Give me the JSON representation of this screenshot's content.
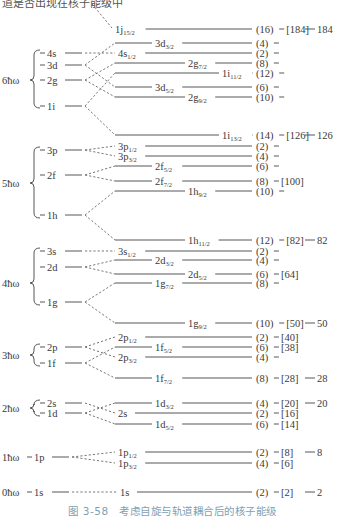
{
  "top_text": "道是否出现在核子能级中",
  "caption": "图 3-58　考虑自旋与轨道耦合后的核子能级",
  "shells": [
    {
      "label": "6ħω",
      "label_y": 80,
      "brace": [
        50,
        108
      ],
      "left_levels": [
        {
          "name": "4s",
          "y": 53
        },
        {
          "name": "3d",
          "y": 65
        },
        {
          "name": "2g",
          "y": 80
        },
        {
          "name": "1i",
          "y": 106
        }
      ]
    },
    {
      "label": "5ħω",
      "label_y": 183,
      "brace": [
        147,
        218
      ],
      "left_levels": [
        {
          "name": "3p",
          "y": 150
        },
        {
          "name": "2f",
          "y": 175
        },
        {
          "name": "1h",
          "y": 215
        }
      ]
    },
    {
      "label": "4ħω",
      "label_y": 283,
      "brace": [
        248,
        305
      ],
      "left_levels": [
        {
          "name": "3s",
          "y": 251
        },
        {
          "name": "2d",
          "y": 267
        },
        {
          "name": "1g",
          "y": 302
        }
      ]
    },
    {
      "label": "3ħω",
      "label_y": 355,
      "brace": [
        344,
        366
      ],
      "left_levels": [
        {
          "name": "2p",
          "y": 347
        },
        {
          "name": "1f",
          "y": 363
        }
      ]
    },
    {
      "label": "2ħω",
      "label_y": 408,
      "brace": [
        400,
        416
      ],
      "left_levels": [
        {
          "name": "2s",
          "y": 403
        },
        {
          "name": "1d",
          "y": 413
        }
      ]
    },
    {
      "label": "1ħω",
      "label_y": 457,
      "brace": null,
      "left_levels": [
        {
          "name": "1p",
          "y": 457
        }
      ]
    },
    {
      "label": "0ħω",
      "label_y": 492,
      "brace": null,
      "left_levels": [
        {
          "name": "1s",
          "y": 492
        }
      ]
    }
  ],
  "split_levels": [
    {
      "base": "1j",
      "sub": "15/2",
      "y": 29,
      "label_x": 115,
      "line_start": 140,
      "degeneracy": "(16)",
      "cumulative": "[184]",
      "magic": "184",
      "from": null
    },
    {
      "base": "3d",
      "sub": "3/2",
      "y": 43,
      "label_x": 155,
      "line_start": 115,
      "degeneracy": "(4)",
      "cumulative": "",
      "magic": "",
      "from": "3d"
    },
    {
      "base": "4s",
      "sub": "1/2",
      "y": 53,
      "label_x": 118,
      "line_start": 140,
      "degeneracy": "(2)",
      "cumulative": "",
      "magic": "",
      "from": "4s"
    },
    {
      "base": "2g",
      "sub": "7/2",
      "y": 63,
      "label_x": 188,
      "line_start": 115,
      "degeneracy": "(8)",
      "cumulative": "",
      "magic": "",
      "from": "2g"
    },
    {
      "base": "1i",
      "sub": "11/2",
      "y": 73,
      "label_x": 222,
      "line_start": 115,
      "degeneracy": "(12)",
      "cumulative": "",
      "magic": "",
      "from": "1i"
    },
    {
      "base": "3d",
      "sub": "5/2",
      "y": 87,
      "label_x": 155,
      "line_start": 115,
      "degeneracy": "(6)",
      "cumulative": "",
      "magic": "",
      "from": "3d"
    },
    {
      "base": "2g",
      "sub": "9/2",
      "y": 97,
      "label_x": 188,
      "line_start": 115,
      "degeneracy": "(10)",
      "cumulative": "",
      "magic": "",
      "from": "2g"
    },
    {
      "base": "1i",
      "sub": "13/2",
      "y": 135,
      "label_x": 222,
      "line_start": 115,
      "degeneracy": "(14)",
      "cumulative": "[126]",
      "magic": "126",
      "from": "1i"
    },
    {
      "base": "3p",
      "sub": "1/2",
      "y": 146,
      "label_x": 118,
      "line_start": 140,
      "degeneracy": "(2)",
      "cumulative": "",
      "magic": "",
      "from": "3p"
    },
    {
      "base": "3p",
      "sub": "3/2",
      "y": 156,
      "label_x": 118,
      "line_start": 140,
      "degeneracy": "(4)",
      "cumulative": "",
      "magic": "",
      "from": "3p"
    },
    {
      "base": "2f",
      "sub": "5/2",
      "y": 166,
      "label_x": 155,
      "line_start": 115,
      "degeneracy": "(6)",
      "cumulative": "",
      "magic": "",
      "from": "2f"
    },
    {
      "base": "2f",
      "sub": "7/2",
      "y": 181,
      "label_x": 155,
      "line_start": 115,
      "degeneracy": "(8)",
      "cumulative": "[100]",
      "magic": "",
      "from": "2f"
    },
    {
      "base": "1h",
      "sub": "9/2",
      "y": 191,
      "label_x": 188,
      "line_start": 115,
      "degeneracy": "(10)",
      "cumulative": "",
      "magic": "",
      "from": "1h"
    },
    {
      "base": "1h",
      "sub": "11/2",
      "y": 240,
      "label_x": 188,
      "line_start": 115,
      "degeneracy": "(12)",
      "cumulative": "[82]",
      "magic": "82",
      "from": "1h"
    },
    {
      "base": "3s",
      "sub": "1/2",
      "y": 251,
      "label_x": 118,
      "line_start": 140,
      "degeneracy": "(2)",
      "cumulative": "",
      "magic": "",
      "from": "3s"
    },
    {
      "base": "2d",
      "sub": "3/2",
      "y": 260,
      "label_x": 155,
      "line_start": 115,
      "degeneracy": "(4)",
      "cumulative": "",
      "magic": "",
      "from": "2d"
    },
    {
      "base": "2d",
      "sub": "5/2",
      "y": 274,
      "label_x": 188,
      "line_start": 115,
      "degeneracy": "(6)",
      "cumulative": "[64]",
      "magic": "",
      "from": "2d"
    },
    {
      "base": "1g",
      "sub": "7/2",
      "y": 283,
      "label_x": 155,
      "line_start": 115,
      "degeneracy": "(8)",
      "cumulative": "",
      "magic": "",
      "from": "1g"
    },
    {
      "base": "1g",
      "sub": "9/2",
      "y": 323,
      "label_x": 188,
      "line_start": 115,
      "degeneracy": "(10)",
      "cumulative": "[50]",
      "magic": "50",
      "from": "1g"
    },
    {
      "base": "2p",
      "sub": "1/2",
      "y": 337,
      "label_x": 118,
      "line_start": 140,
      "degeneracy": "(2)",
      "cumulative": "[40]",
      "magic": "",
      "from": "2p"
    },
    {
      "base": "1f",
      "sub": "5/2",
      "y": 347,
      "label_x": 155,
      "line_start": 115,
      "degeneracy": "(6)",
      "cumulative": "[38]",
      "magic": "",
      "from": "1f"
    },
    {
      "base": "2p",
      "sub": "3/2",
      "y": 357,
      "label_x": 118,
      "line_start": 140,
      "degeneracy": "(4)",
      "cumulative": "",
      "magic": "",
      "from": "2p"
    },
    {
      "base": "1f",
      "sub": "7/2",
      "y": 378,
      "label_x": 155,
      "line_start": 115,
      "degeneracy": "(8)",
      "cumulative": "[28]",
      "magic": "28",
      "from": "1f"
    },
    {
      "base": "1d",
      "sub": "3/2",
      "y": 403,
      "label_x": 155,
      "line_start": 115,
      "degeneracy": "(4)",
      "cumulative": "[20]",
      "magic": "20",
      "from": "1d"
    },
    {
      "base": "2s",
      "sub": "",
      "y": 413,
      "label_x": 118,
      "line_start": 140,
      "degeneracy": "(2)",
      "cumulative": "[16]",
      "magic": "",
      "from": "2s"
    },
    {
      "base": "1d",
      "sub": "5/2",
      "y": 424,
      "label_x": 155,
      "line_start": 115,
      "degeneracy": "(6)",
      "cumulative": "[14]",
      "magic": "",
      "from": "1d"
    },
    {
      "base": "1p",
      "sub": "1/2",
      "y": 452,
      "label_x": 118,
      "line_start": 140,
      "degeneracy": "(2)",
      "cumulative": "[8]",
      "magic": "8",
      "from": "1p"
    },
    {
      "base": "1p",
      "sub": "3/2",
      "y": 463,
      "label_x": 118,
      "line_start": 140,
      "degeneracy": "(4)",
      "cumulative": "[6]",
      "magic": "",
      "from": "1p"
    },
    {
      "base": "1s",
      "sub": "",
      "y": 492,
      "label_x": 120,
      "line_start": 135,
      "degeneracy": "(2)",
      "cumulative": "[2]",
      "magic": "2",
      "from": "1s"
    }
  ],
  "colors": {
    "line": "#444444",
    "text": "#3a3a3a",
    "caption": "#7f9fb3"
  }
}
